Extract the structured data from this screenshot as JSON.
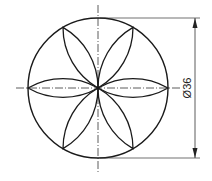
{
  "drawing": {
    "type": "technical-drawing",
    "title": "Six-petal rosette in circle",
    "circle": {
      "cx": 98,
      "cy": 88,
      "r": 70
    },
    "petals": 6,
    "centerlines": true,
    "dimension": {
      "label": "Ø36",
      "orientation": "vertical"
    },
    "colors": {
      "line": "#1a1a1a",
      "background": "#ffffff"
    }
  }
}
